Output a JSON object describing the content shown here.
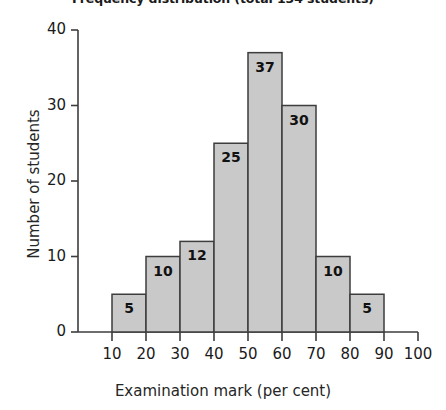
{
  "chart_data": {
    "type": "bar",
    "title": "Frequency distribution (total 134 students)",
    "xlabel": "Examination mark (per cent)",
    "ylabel": "Number of students",
    "categories": [
      "10-20",
      "20-30",
      "30-40",
      "40-50",
      "50-60",
      "60-70",
      "70-80",
      "80-90"
    ],
    "bin_edges": [
      10,
      20,
      30,
      40,
      50,
      60,
      70,
      80,
      90
    ],
    "values": [
      5,
      10,
      12,
      25,
      37,
      30,
      10,
      5
    ],
    "bar_labels": [
      "5",
      "10",
      "12",
      "25",
      "37",
      "30",
      "10",
      "5"
    ],
    "total": 134,
    "xlim": [
      0,
      100
    ],
    "ylim": [
      0,
      40
    ],
    "xticks": [
      10,
      20,
      30,
      40,
      50,
      60,
      70,
      80,
      90,
      100
    ],
    "xtick_labels": [
      "10",
      "20",
      "30",
      "40",
      "50",
      "60",
      "70",
      "80",
      "90",
      "100"
    ],
    "yticks": [
      0,
      10,
      20,
      30,
      40
    ],
    "ytick_labels": [
      "0",
      "10",
      "20",
      "30",
      "40"
    ],
    "grid": false,
    "legend": false,
    "bar_fill_color": "#c9c9c9",
    "bar_edge_color": "#3d3d3d",
    "axis_color": "#3d3d3d",
    "text_color": "#1a1a1a",
    "background_color": "#ffffff"
  }
}
